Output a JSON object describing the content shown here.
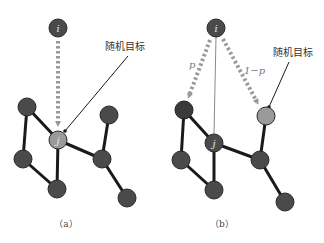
{
  "panels": [
    {
      "id": "a",
      "caption": "（a）",
      "annotation": "随机目标",
      "nodes": {
        "i": {
          "label": "i"
        },
        "j": {
          "label": "j"
        }
      }
    },
    {
      "id": "b",
      "caption": "（b）",
      "annotation": "随机目标",
      "prob_left": "p",
      "prob_right": "1−p",
      "nodes": {
        "i": {
          "label": "i"
        },
        "j": {
          "label": "j"
        }
      }
    }
  ],
  "colors": {
    "node_dark": "#4a4a4a",
    "node_target": "#9a9a9a",
    "edge": "#1a1a1a",
    "dotted_arrow": "#999999"
  }
}
